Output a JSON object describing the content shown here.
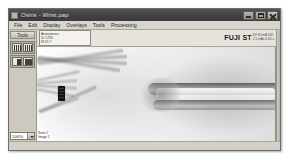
{
  "window": {
    "title": "Osiris - Wrist.pap",
    "icon": "app-icon",
    "controls": {
      "minimize": "minimize-icon",
      "maximize": "maximize-icon",
      "close": "close-icon"
    }
  },
  "menu": {
    "items": [
      {
        "label": "File"
      },
      {
        "label": "Edit"
      },
      {
        "label": "Display"
      },
      {
        "label": "Overlays"
      },
      {
        "label": "Tools"
      },
      {
        "label": "Processing"
      }
    ]
  },
  "sidebar": {
    "tab_label": "Tools",
    "tool_rows": [
      {
        "buttons": [
          {
            "name": "window-level-tool",
            "style": "stripe"
          },
          {
            "name": "zoom-tool",
            "style": "stripe"
          }
        ]
      },
      {
        "buttons": [
          {
            "name": "contrast-tool",
            "style": "half"
          },
          {
            "name": "invert-tool",
            "style": "dark"
          }
        ]
      }
    ],
    "zoom": {
      "value": "100%",
      "arrow_icon": "chevron-down-icon"
    }
  },
  "dicom_header": {
    "patient_info": [
      "Anonymous",
      "ID 1234",
      "M 55 Y"
    ],
    "vendor": "FUJI ST",
    "vendor_meta": [
      "KV 60 mA 200",
      "2.5 mAs 0.06 s"
    ]
  },
  "image": {
    "modality": "x-ray-hand-wrist",
    "marker": "radiopaque-marker",
    "overlay_bottom_left": [
      "Serie 1",
      "Image 1"
    ]
  },
  "status_bar": {
    "text": ""
  },
  "colors": {
    "titlebar": "#434244",
    "chrome": "#d4d0c8",
    "border": "#8f8b82",
    "marker": "#141414"
  }
}
